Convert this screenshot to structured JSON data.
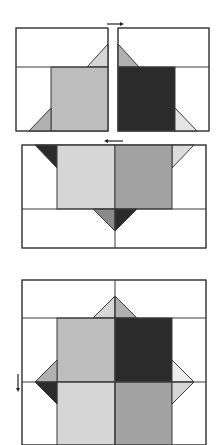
{
  "diagram": {
    "colors": {
      "outline": "#3a3a3a",
      "background": "#ffffff",
      "light": "#d6d6d6",
      "medium_light": "#bdbdbd",
      "medium": "#a2a2a2",
      "dark": "#2b2b2b"
    },
    "steps": [
      {
        "id": "step-1",
        "description": "Join two units side by side",
        "arrow": "right"
      },
      {
        "id": "step-2",
        "description": "Join row with top and bottom units",
        "arrow": "left"
      },
      {
        "id": "step-3",
        "description": "Assembled block",
        "arrow": "down"
      }
    ]
  }
}
